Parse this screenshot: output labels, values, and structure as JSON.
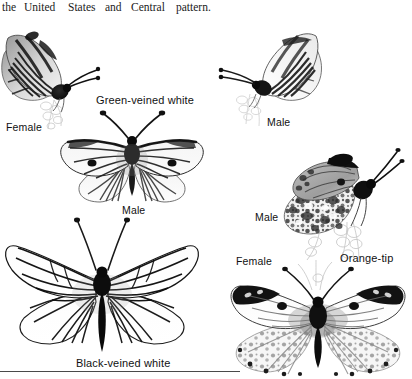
{
  "page": {
    "background_color": "#ffffff",
    "ink_color": "#111111",
    "width": 412,
    "height": 379
  },
  "header": {
    "words": [
      "the",
      "United",
      "States",
      "and",
      "Central",
      "pattern."
    ],
    "full_text": "the United States and Central    pattern."
  },
  "species": [
    {
      "id": "green-veined-white",
      "name": "Green-veined white",
      "label_x": 96,
      "label_y": 94
    },
    {
      "id": "black-veined-white",
      "name": "Black-veined white",
      "label_x": 76,
      "label_y": 358
    },
    {
      "id": "orange-tip",
      "name": "Orange-tip",
      "label_x": 340,
      "label_y": 253
    }
  ],
  "sex_labels": [
    {
      "id": "gvw-female-side",
      "text": "Female",
      "x": 6,
      "y": 121,
      "for_species": "green-veined-white",
      "view": "side"
    },
    {
      "id": "gvw-male-side",
      "text": "Male",
      "x": 267,
      "y": 117,
      "for_species": "green-veined-white",
      "view": "side"
    },
    {
      "id": "gvw-male-spread",
      "text": "Male",
      "x": 122,
      "y": 205,
      "for_species": "green-veined-white",
      "view": "spread"
    },
    {
      "id": "ot-male-side",
      "text": "Male",
      "x": 255,
      "y": 212,
      "for_species": "orange-tip",
      "view": "side"
    },
    {
      "id": "ot-female-spread",
      "text": "Female",
      "x": 236,
      "y": 256,
      "for_species": "orange-tip",
      "view": "spread"
    }
  ],
  "figures": [
    {
      "id": "fig-gvw-female-side",
      "species": "green-veined-white",
      "sex": "Female",
      "view": "side-view-perched",
      "facing": "right",
      "x": 0,
      "y": 16,
      "width": 112,
      "height": 112,
      "description": "Green-veined white female, wings closed, perched on flower, heavy dark veining"
    },
    {
      "id": "fig-gvw-male-side",
      "species": "green-veined-white",
      "sex": "Male",
      "view": "side-view-perched",
      "facing": "left",
      "x": 210,
      "y": 18,
      "width": 112,
      "height": 108,
      "description": "Green-veined white male, wings closed, perched on flower, fine grey veining"
    },
    {
      "id": "fig-gvw-male-spread",
      "species": "green-veined-white",
      "sex": "Male",
      "view": "spread-wings-upper",
      "facing": "up",
      "x": 50,
      "y": 110,
      "width": 162,
      "height": 100,
      "description": "Green-veined white male, wings spread, dark forewing tip and veins"
    },
    {
      "id": "fig-ot-male-side",
      "species": "orange-tip",
      "sex": "Male",
      "view": "side-view-perched",
      "facing": "right",
      "x": 258,
      "y": 142,
      "width": 150,
      "height": 120,
      "description": "Orange-tip male, wings closed, mottled green-and-white hindwing, black forewing apex"
    },
    {
      "id": "fig-ot-female-spread",
      "species": "orange-tip",
      "sex": "Female",
      "view": "spread-wings-upper",
      "facing": "up",
      "x": 228,
      "y": 268,
      "width": 184,
      "height": 111,
      "description": "Orange-tip female, wings spread, black forewing tips, mottled underside hindwing showing"
    },
    {
      "id": "fig-bvw-spread",
      "species": "black-veined-white",
      "sex": "",
      "view": "spread-wings-upper",
      "facing": "up",
      "x": 4,
      "y": 216,
      "width": 196,
      "height": 140,
      "description": "Black-veined white, wings spread, translucent white wings with strong black veins"
    }
  ],
  "rule": {
    "x": 0,
    "y": 371,
    "width": 240
  }
}
